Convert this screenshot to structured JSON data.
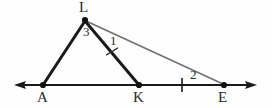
{
  "figure": {
    "type": "geometry-diagram",
    "background_color": "#fefefe",
    "stroke_dark": "#1a1a1a",
    "stroke_light": "#6f6f6f",
    "label_color": "#2b2b2b",
    "vertices": [
      {
        "name": "L",
        "label": "L",
        "x": 85,
        "y": 20,
        "label_x": 80,
        "label_y": 1,
        "dot": true
      },
      {
        "name": "A",
        "label": "A",
        "x": 43,
        "y": 85,
        "label_x": 38,
        "label_y": 90,
        "dot": true
      },
      {
        "name": "K",
        "label": "K",
        "x": 139,
        "y": 85,
        "label_x": 134,
        "label_y": 90,
        "dot": true
      },
      {
        "name": "E",
        "label": "E",
        "x": 224,
        "y": 85,
        "label_x": 219,
        "label_y": 90,
        "dot": true
      }
    ],
    "angle_labels": [
      {
        "name": "angle-3-at-L",
        "label": "3",
        "x": 83,
        "y": 25,
        "vertex": "L",
        "between": [
          "L-A",
          "L-K"
        ]
      },
      {
        "name": "angle-1-at-L",
        "label": "1",
        "x": 109,
        "y": 33,
        "vertex": "L",
        "between": [
          "L-K",
          "L-E"
        ]
      },
      {
        "name": "angle-2-at-E",
        "label": "2",
        "x": 190,
        "y": 67,
        "vertex": "E",
        "between": [
          "E-L",
          "E-baseline"
        ]
      }
    ],
    "segments": [
      {
        "name": "segment-L-A",
        "from": "L",
        "to": "A",
        "weight": "thick",
        "color": "#1a1a1a"
      },
      {
        "name": "segment-L-K",
        "from": "L",
        "to": "K",
        "weight": "thick",
        "color": "#1a1a1a"
      },
      {
        "name": "segment-L-E",
        "from": "L",
        "to": "E",
        "weight": "thin",
        "color": "#6f6f6f"
      }
    ],
    "baseline": {
      "name": "baseline-A-E",
      "y": 85,
      "x_start": 15,
      "x_end": 256,
      "arrow_left": true,
      "arrow_right": true,
      "color": "#1a1a1a"
    },
    "tick_marks": [
      {
        "name": "tick-on-LK",
        "x": 112,
        "y": 52,
        "angle_deg": 62
      },
      {
        "name": "tick-on-KE",
        "x": 182,
        "y": 85,
        "angle_deg": 0
      }
    ]
  }
}
